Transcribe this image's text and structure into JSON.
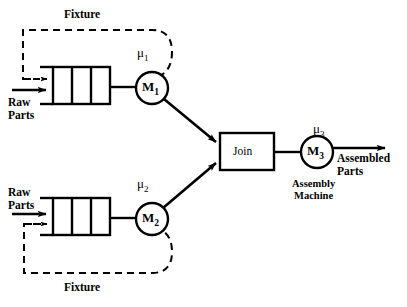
{
  "figure": {
    "type": "manufacturing-assembly-queueing-network-diagram",
    "background_color": "#ffffff",
    "line_color": "#000000"
  },
  "lines": {
    "top_fixture_label": "Fixture",
    "bottom_fixture_label": "Fixture"
  },
  "inputs": {
    "top_raw_parts": "Raw\nParts",
    "top_raw_parts_line1": "Raw",
    "top_raw_parts_line2": "Parts",
    "bottom_raw_parts_line1": "Raw",
    "bottom_raw_parts_line2": "Parts"
  },
  "machines": [
    {
      "id": "M1",
      "label_base": "M",
      "label_sub": "1",
      "rate_base": "μ",
      "rate_sub": "1",
      "cx": 152,
      "cy": 88,
      "r": 16
    },
    {
      "id": "M2",
      "label_base": "M",
      "label_sub": "2",
      "rate_base": "μ",
      "rate_sub": "2",
      "cx": 152,
      "cy": 219,
      "r": 16
    },
    {
      "id": "M3",
      "label_base": "M",
      "label_sub": "3",
      "rate_base": "μ",
      "rate_sub": "3",
      "cx": 317,
      "cy": 152,
      "r": 16,
      "caption_line1": "Assembly",
      "caption_line2": "Machine"
    }
  ],
  "join": {
    "label": "Join",
    "x": 220,
    "y": 133,
    "width": 54,
    "height": 37
  },
  "queues": [
    {
      "id": "queue-top",
      "x": 53,
      "y": 67,
      "width": 57,
      "height": 37,
      "slots": 3
    },
    {
      "id": "queue-bottom",
      "x": 53,
      "y": 198,
      "width": 57,
      "height": 37,
      "slots": 3
    }
  ],
  "output": {
    "label_line1": "Assembled",
    "label_line2": "Parts"
  }
}
